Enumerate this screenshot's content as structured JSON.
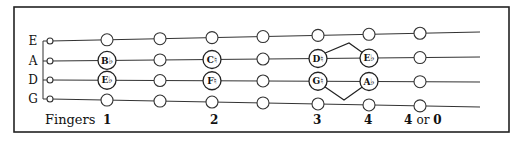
{
  "diagram": {
    "frame": {
      "x": 14,
      "y": 7,
      "w": 495,
      "h": 125
    },
    "strings": [
      {
        "name": "E",
        "y_left": 41,
        "y_right": 32
      },
      {
        "name": "A",
        "y_left": 61,
        "y_right": 57
      },
      {
        "name": "D",
        "y_left": 80,
        "y_right": 82
      },
      {
        "name": "G",
        "y_left": 99,
        "y_right": 107
      }
    ],
    "line_x_start": 50,
    "line_x_end": 480,
    "label_x": 33,
    "bracket_x": 43,
    "open_x": 50,
    "columns_x": [
      107,
      160,
      212,
      263,
      318,
      369,
      420
    ],
    "labeled_notes": [
      {
        "string": 1,
        "column": 0,
        "label": "B♭"
      },
      {
        "string": 2,
        "column": 0,
        "label": "E♭"
      },
      {
        "string": 1,
        "column": 2,
        "label": "C♮"
      },
      {
        "string": 2,
        "column": 2,
        "label": "F♮"
      },
      {
        "string": 1,
        "column": 4,
        "label": "D♮"
      },
      {
        "string": 2,
        "column": 4,
        "label": "G♮"
      },
      {
        "string": 1,
        "column": 5,
        "label": "E♭"
      },
      {
        "string": 2,
        "column": 5,
        "label": "A♭"
      }
    ],
    "connectors": [
      {
        "from": {
          "string": 1,
          "column": 4
        },
        "to": {
          "string": 1,
          "column": 5
        },
        "peak": [
          349,
          43
        ]
      },
      {
        "from": {
          "string": 2,
          "column": 4
        },
        "to": {
          "string": 2,
          "column": 5
        },
        "peak": [
          344,
          100
        ]
      }
    ],
    "fingers": {
      "title": "Fingers",
      "title_x": 45,
      "y": 124,
      "numbers": [
        {
          "text": "1",
          "x": 103
        },
        {
          "text": "2",
          "x": 210
        },
        {
          "text": "3",
          "x": 313
        },
        {
          "text": "4",
          "x": 364
        }
      ],
      "last": {
        "num1": "4",
        "or": "or",
        "num2": "0",
        "x": 404
      }
    }
  }
}
